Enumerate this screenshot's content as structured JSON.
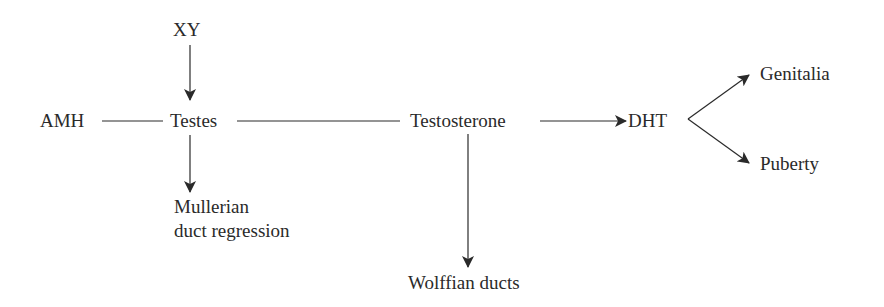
{
  "diagram": {
    "type": "flowchart",
    "nodes": {
      "xy": "XY",
      "amh": "AMH",
      "testes": "Testes",
      "testosterone": "Testosterone",
      "dht": "DHT",
      "genitalia": "Genitalia",
      "puberty": "Puberty",
      "mullerian_line1": "Mullerian",
      "mullerian_line2": "duct regression",
      "wolffian": "Wolffian ducts"
    },
    "edges": [
      {
        "from": "XY",
        "to": "Testes",
        "style": "arrow"
      },
      {
        "from": "AMH",
        "to": "Testes",
        "style": "line"
      },
      {
        "from": "Testes",
        "to": "Testosterone",
        "style": "line"
      },
      {
        "from": "Testes",
        "to": "Mullerian duct regression",
        "style": "arrow"
      },
      {
        "from": "Testosterone",
        "to": "DHT",
        "style": "arrow"
      },
      {
        "from": "Testosterone",
        "to": "Wolffian ducts",
        "style": "arrow"
      },
      {
        "from": "DHT",
        "to": "Genitalia",
        "style": "arrow"
      },
      {
        "from": "DHT",
        "to": "Puberty",
        "style": "arrow"
      }
    ],
    "colors": {
      "ink": "#2a2a2a",
      "background": "#ffffff"
    }
  }
}
